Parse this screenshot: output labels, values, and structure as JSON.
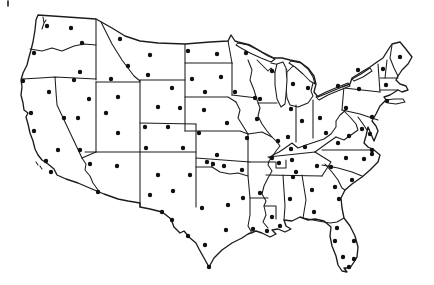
{
  "figure": {
    "type": "outline-map",
    "region": "Contiguous United States",
    "background_color": "#ffffff",
    "line_color": "#1c1c1c",
    "dot_color": "#101010",
    "dot_radius": 2.2,
    "artifact_tick": {
      "x": 8,
      "y1": 1,
      "y2": 6
    }
  },
  "stations": {
    "count": 119,
    "points": [
      [
        47,
        26
      ],
      [
        71,
        28
      ],
      [
        82,
        43
      ],
      [
        34,
        53
      ],
      [
        80,
        72
      ],
      [
        23,
        81
      ],
      [
        49,
        92
      ],
      [
        31,
        113
      ],
      [
        34,
        131
      ],
      [
        58,
        150
      ],
      [
        46,
        161
      ],
      [
        51,
        172
      ],
      [
        74,
        80
      ],
      [
        89,
        99
      ],
      [
        64,
        118
      ],
      [
        78,
        118
      ],
      [
        80,
        150
      ],
      [
        120,
        39
      ],
      [
        150,
        55
      ],
      [
        128,
        66
      ],
      [
        148,
        75
      ],
      [
        111,
        79
      ],
      [
        118,
        97
      ],
      [
        106,
        113
      ],
      [
        118,
        133
      ],
      [
        172,
        88
      ],
      [
        158,
        107
      ],
      [
        180,
        108
      ],
      [
        145,
        127
      ],
      [
        168,
        127
      ],
      [
        146,
        148
      ],
      [
        183,
        148
      ],
      [
        90,
        164
      ],
      [
        117,
        166
      ],
      [
        98,
        192
      ],
      [
        158,
        175
      ],
      [
        190,
        175
      ],
      [
        150,
        195
      ],
      [
        173,
        191
      ],
      [
        162,
        212
      ],
      [
        188,
        51
      ],
      [
        217,
        54
      ],
      [
        246,
        53
      ],
      [
        235,
        92
      ],
      [
        192,
        79
      ],
      [
        221,
        77
      ],
      [
        205,
        92
      ],
      [
        204,
        110
      ],
      [
        227,
        123
      ],
      [
        247,
        138
      ],
      [
        217,
        155
      ],
      [
        199,
        133
      ],
      [
        255,
        98
      ],
      [
        257,
        119
      ],
      [
        278,
        141
      ],
      [
        279,
        163
      ],
      [
        260,
        99
      ],
      [
        272,
        71
      ],
      [
        291,
        109
      ],
      [
        302,
        121
      ],
      [
        288,
        137
      ],
      [
        291,
        149
      ],
      [
        320,
        118
      ],
      [
        326,
        133
      ],
      [
        338,
        86
      ],
      [
        346,
        108
      ],
      [
        372,
        117
      ],
      [
        387,
        101
      ],
      [
        362,
        129
      ],
      [
        370,
        134
      ],
      [
        349,
        136
      ],
      [
        338,
        143
      ],
      [
        372,
        150
      ],
      [
        358,
        70
      ],
      [
        383,
        69
      ],
      [
        400,
        57
      ],
      [
        386,
        85
      ],
      [
        359,
        89
      ],
      [
        293,
        84
      ],
      [
        308,
        88
      ],
      [
        272,
        158
      ],
      [
        305,
        147
      ],
      [
        292,
        160
      ],
      [
        296,
        172
      ],
      [
        317,
        166
      ],
      [
        331,
        167
      ],
      [
        346,
        158
      ],
      [
        364,
        159
      ],
      [
        372,
        154
      ],
      [
        352,
        180
      ],
      [
        312,
        190
      ],
      [
        335,
        187
      ],
      [
        339,
        199
      ],
      [
        314,
        212
      ],
      [
        293,
        177
      ],
      [
        290,
        199
      ],
      [
        272,
        217
      ],
      [
        337,
        228
      ],
      [
        335,
        241
      ],
      [
        354,
        241
      ],
      [
        343,
        257
      ],
      [
        354,
        259
      ],
      [
        349,
        267
      ],
      [
        213,
        164
      ],
      [
        224,
        166
      ],
      [
        242,
        170
      ],
      [
        260,
        193
      ],
      [
        243,
        198
      ],
      [
        267,
        231
      ],
      [
        280,
        226
      ],
      [
        253,
        229
      ],
      [
        226,
        230
      ],
      [
        228,
        205
      ],
      [
        207,
        162
      ],
      [
        202,
        208
      ],
      [
        172,
        220
      ],
      [
        188,
        236
      ],
      [
        205,
        245
      ],
      [
        209,
        267
      ]
    ]
  }
}
